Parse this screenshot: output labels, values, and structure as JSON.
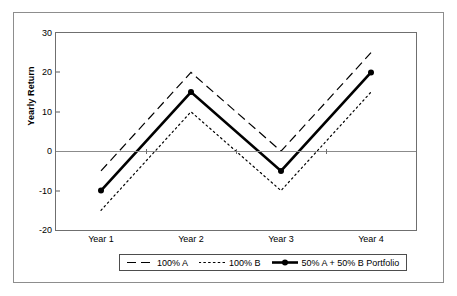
{
  "chart_data": {
    "type": "line",
    "title": "",
    "xlabel": "",
    "ylabel": "Yearly Return",
    "categories": [
      "Year 1",
      "Year 2",
      "Year 3",
      "Year 4"
    ],
    "ylim": [
      -20,
      30
    ],
    "yticks": [
      30,
      20,
      10,
      0,
      -10,
      -20
    ],
    "ytick_labels": [
      "30",
      "20",
      "10",
      "0",
      "-10",
      "-20"
    ],
    "grid": false,
    "zero_line": true,
    "legend_position": "bottom",
    "series": [
      {
        "name": "100% A",
        "values": [
          -5,
          20,
          0,
          25
        ],
        "style": "dashed",
        "color": "#000000",
        "markers": false
      },
      {
        "name": "100% B",
        "values": [
          -15,
          10,
          -10,
          15
        ],
        "style": "dotted",
        "color": "#000000",
        "markers": false
      },
      {
        "name": "50% A + 50% B Portfolio",
        "values": [
          -10,
          15,
          -5,
          20
        ],
        "style": "solid",
        "color": "#000000",
        "markers": true
      }
    ]
  },
  "axis": {
    "y_title": "Yearly Return",
    "y_labels": [
      "30",
      "20",
      "10",
      "0",
      "-10",
      "-20"
    ],
    "x_labels": [
      "Year 1",
      "Year 2",
      "Year 3",
      "Year 4"
    ]
  },
  "legend": {
    "items": [
      {
        "label": "100% A",
        "swatch": "dashed-line-swatch"
      },
      {
        "label": "100% B",
        "swatch": "dotted-line-swatch"
      },
      {
        "label": "50% A + 50% B Portfolio",
        "swatch": "solid-line-marker-swatch"
      }
    ]
  },
  "colors": {
    "line": "#000000",
    "frame": "#6f6f6f",
    "outer_border": "#8d8d8d",
    "zero_line": "#8b8b8b",
    "background": "#ffffff"
  }
}
